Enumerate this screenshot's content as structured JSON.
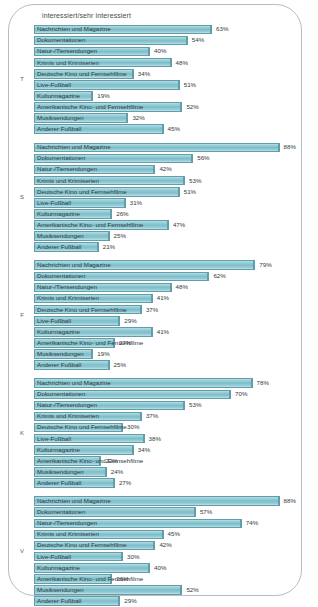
{
  "chart": {
    "title": "interessiert/sehr interessiert",
    "bar_color": "#8cc8d2",
    "bar_border_color": "#5f9fad",
    "frame_color": "#b9bcc0"
  },
  "chart_data": {
    "type": "bar",
    "title": "interessiert/sehr interessiert",
    "xlabel": "",
    "ylabel": "",
    "xlim": [
      0,
      100
    ],
    "grid": false,
    "orientation": "horizontal",
    "value_suffix": "%",
    "categories": [
      "Nachrichten und Magazine",
      "Dokumentationen",
      "Natur-/Tiersendungen",
      "Krimis und Krimiserien",
      "Deutsche Kino und Fernsehfilme",
      "Live-Fußball",
      "Kulturmagazine",
      "Amerikanische Kino- und Fernsehfilme",
      "Musiksendungen",
      "Anderer Fußball"
    ],
    "groups": [
      {
        "letter": "T",
        "values": [
          63,
          54,
          40,
          48,
          34,
          51,
          19,
          52,
          32,
          45
        ]
      },
      {
        "letter": "S",
        "values": [
          88,
          56,
          42,
          53,
          51,
          31,
          26,
          47,
          25,
          21
        ]
      },
      {
        "letter": "F",
        "values": [
          79,
          62,
          48,
          41,
          37,
          29,
          41,
          27,
          19,
          25
        ]
      },
      {
        "letter": "K",
        "values": [
          78,
          70,
          53,
          37,
          30,
          38,
          34,
          22,
          24,
          27
        ]
      },
      {
        "letter": "V",
        "values": [
          88,
          57,
          74,
          45,
          42,
          30,
          40,
          26,
          52,
          29
        ]
      }
    ]
  }
}
